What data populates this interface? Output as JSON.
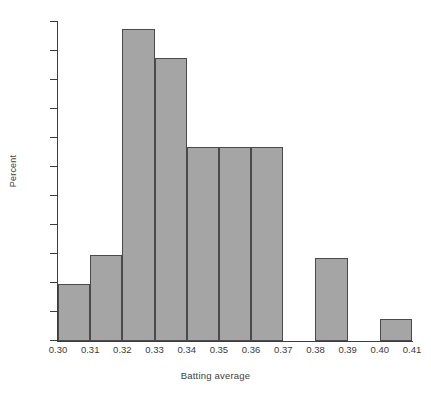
{
  "chart_data": {
    "type": "bar",
    "title": "",
    "xlabel": "Batting average",
    "ylabel": "Percent",
    "grid": false,
    "legend": null,
    "xlim": [
      0.3,
      0.41
    ],
    "ylim": [
      0,
      0.22
    ],
    "bin_width": 0.01,
    "xticks": [
      "0.30",
      "0.31",
      "0.32",
      "0.33",
      "0.34",
      "0.35",
      "0.36",
      "0.37",
      "0.38",
      "0.39",
      "0.40",
      "0.41"
    ],
    "xtick_values": [
      0.3,
      0.31,
      0.32,
      0.33,
      0.34,
      0.35,
      0.36,
      0.37,
      0.38,
      0.39,
      0.4,
      0.41
    ],
    "yticks": [
      "0",
      "0.02",
      "0.04",
      "0.06",
      "0.08",
      "0.10",
      "0.12",
      "0.14",
      "0.16",
      "0.18",
      "0.20",
      "0.22"
    ],
    "ytick_values": [
      0,
      0.02,
      0.04,
      0.06,
      0.08,
      0.1,
      0.12,
      0.14,
      0.16,
      0.18,
      0.2,
      0.22
    ],
    "categories": [
      "0.30-0.31",
      "0.31-0.32",
      "0.32-0.33",
      "0.33-0.34",
      "0.34-0.35",
      "0.35-0.36",
      "0.36-0.37",
      "0.37-0.38",
      "0.38-0.39",
      "0.39-0.40",
      "0.40-0.41"
    ],
    "bin_starts": [
      0.3,
      0.31,
      0.32,
      0.33,
      0.34,
      0.35,
      0.36,
      0.37,
      0.38,
      0.39,
      0.4
    ],
    "values": [
      0.039,
      0.059,
      0.215,
      0.195,
      0.134,
      0.134,
      0.134,
      0.0,
      0.057,
      0.0,
      0.015
    ],
    "colors": {
      "bar_fill": "#a5a5a5",
      "bar_edge": "#4a4a4a",
      "axis": "#3d3d3d",
      "text": "#3a3a3a",
      "background": "#ffffff"
    }
  }
}
